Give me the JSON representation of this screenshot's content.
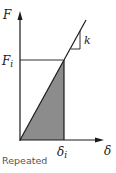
{
  "diagram": {
    "y_axis_label": "F",
    "x_axis_label": "δ",
    "force_level_label": "F",
    "force_level_subscript": "i",
    "displacement_label": "δ",
    "displacement_subscript": "i",
    "slope_label": "k",
    "caption": "Repeated",
    "colors": {
      "line": "#1a1a1a",
      "fill": "#8c8c8c",
      "caption": "#555555"
    }
  }
}
